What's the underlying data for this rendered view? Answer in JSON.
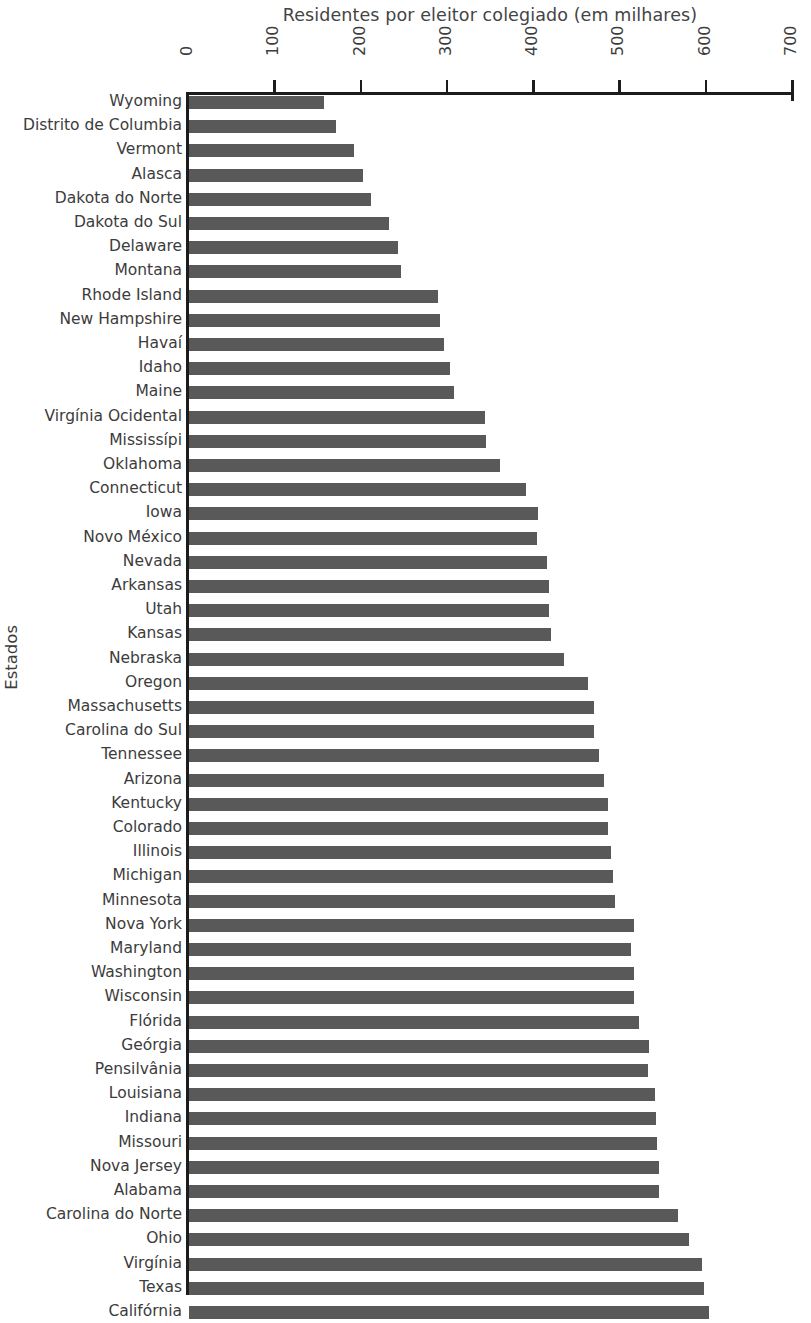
{
  "chart_data": {
    "type": "bar",
    "orientation": "horizontal",
    "title": "Residentes por eleitor colegiado (em milhares)",
    "xlabel": "Residentes por eleitor colegiado (em milhares)",
    "ylabel": "Estados",
    "xlim": [
      0,
      700
    ],
    "xticks": [
      0,
      100,
      200,
      300,
      400,
      500,
      600,
      700
    ],
    "xtick_labels": [
      "0",
      "100",
      "200",
      "300",
      "400",
      "500",
      "600",
      "700"
    ],
    "grid": false,
    "legend": null,
    "bar_color": "#595959",
    "axis_color": "#1c1c1c",
    "categories": [
      "Wyoming",
      "Distrito de Columbia",
      "Vermont",
      "Alasca",
      "Dakota do Norte",
      "Dakota do Sul",
      "Delaware",
      "Montana",
      "Rhode Island",
      "New Hampshire",
      "Havaí",
      "Idaho",
      "Maine",
      "Virgínia Ocidental",
      "Mississípi",
      "Oklahoma",
      "Connecticut",
      "Iowa",
      "Novo México",
      "Nevada",
      "Arkansas",
      "Utah",
      "Kansas",
      "Nebraska",
      "Oregon",
      "Massachusetts",
      "Carolina do Sul",
      "Tennessee",
      "Arizona",
      "Kentucky",
      "Colorado",
      "Illinois",
      "Michigan",
      "Minnesota",
      "Nova York",
      "Maryland",
      "Washington",
      "Wisconsin",
      "Flórida",
      "Geórgia",
      "Pensilvânia",
      "Louisiana",
      "Indiana",
      "Missouri",
      "Nova Jersey",
      "Alabama",
      "Carolina do Norte",
      "Ohio",
      "Virgínia",
      "Texas",
      "Califórnia"
    ],
    "values": [
      156,
      170,
      191,
      202,
      211,
      232,
      242,
      246,
      288,
      291,
      295,
      303,
      307,
      343,
      344,
      360,
      390,
      404,
      403,
      415,
      417,
      417,
      420,
      435,
      462,
      469,
      469,
      475,
      481,
      486,
      486,
      489,
      491,
      494,
      516,
      512,
      516,
      516,
      522,
      533,
      532,
      540,
      541,
      542,
      545,
      545,
      567,
      579,
      595,
      597,
      603
    ]
  }
}
